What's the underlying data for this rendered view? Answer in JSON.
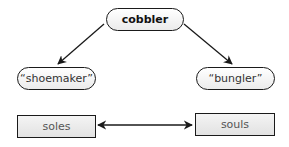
{
  "diagram": {
    "nodes": {
      "root": {
        "label": "cobbler",
        "shape": "rounded"
      },
      "left_meaning": {
        "label": "“shoemaker”",
        "shape": "rounded"
      },
      "right_meaning": {
        "label": "“bungler”",
        "shape": "rounded"
      },
      "left_word": {
        "label": "soles",
        "shape": "rectangle"
      },
      "right_word": {
        "label": "souls",
        "shape": "rectangle"
      }
    },
    "edges": [
      {
        "from": "cobbler",
        "to": "“shoemaker”",
        "type": "arrow"
      },
      {
        "from": "cobbler",
        "to": "“bungler”",
        "type": "arrow"
      },
      {
        "from": "soles",
        "to": "souls",
        "type": "double-arrow"
      }
    ],
    "colors": {
      "stroke": "#1a1a1a",
      "fill_light": "#ffffff",
      "fill_dark": "#e6e6e6",
      "text": "#333333"
    }
  }
}
